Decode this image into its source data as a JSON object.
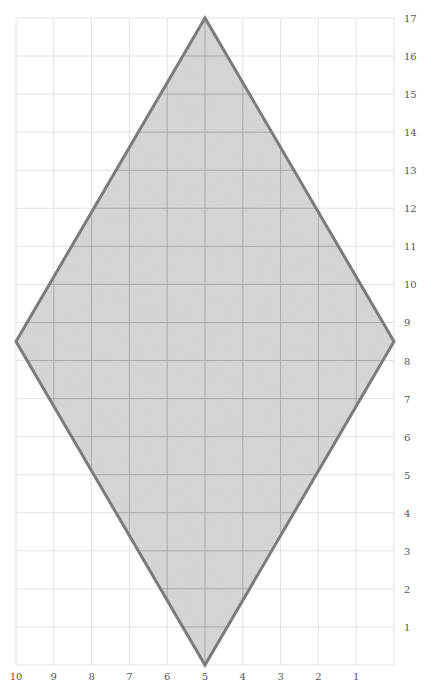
{
  "diagram": {
    "type": "shape-on-grid",
    "shape": "rhombus",
    "vertices": [
      {
        "name": "top",
        "x": 5,
        "y": 17
      },
      {
        "name": "right",
        "x": 0,
        "y": 8.5
      },
      {
        "name": "bottom",
        "x": 5,
        "y": 0
      },
      {
        "name": "left",
        "x": 10,
        "y": 8.5
      }
    ],
    "x_axis": {
      "direction": "reversed",
      "range": [
        10,
        0
      ],
      "tick_labels": [
        "10",
        "9",
        "8",
        "7",
        "6",
        "5",
        "4",
        "3",
        "2",
        "1"
      ],
      "tick_values": [
        10,
        9,
        8,
        7,
        6,
        5,
        4,
        3,
        2,
        1
      ]
    },
    "y_axis": {
      "position": "right",
      "range": [
        0,
        17
      ],
      "tick_labels": [
        "1",
        "2",
        "3",
        "4",
        "5",
        "6",
        "7",
        "8",
        "9",
        "10",
        "11",
        "12",
        "13",
        "14",
        "15",
        "16",
        "17"
      ],
      "tick_values": [
        1,
        2,
        3,
        4,
        5,
        6,
        7,
        8,
        9,
        10,
        11,
        12,
        13,
        14,
        15,
        16,
        17
      ]
    },
    "grid": true,
    "colors": {
      "fill": "#d6d6d6",
      "outline": "#7b7b7b",
      "grid_outside": "#e2e2e2",
      "grid_inside": "#a9a9a9",
      "label": "#555555"
    }
  }
}
